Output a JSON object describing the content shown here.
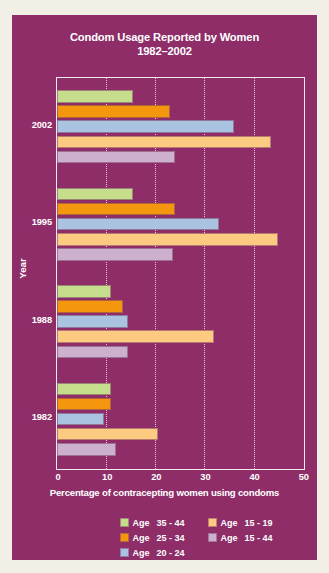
{
  "chart_data": {
    "type": "bar",
    "orientation": "horizontal",
    "title": "Condom Usage Reported by Women",
    "subtitle": "1982–2002",
    "xlabel": "Percentage of contracepting women using condoms",
    "ylabel": "Year",
    "xlim": [
      0,
      50
    ],
    "xticks": [
      0,
      10,
      20,
      30,
      40,
      50
    ],
    "xtick_labels": [
      "0",
      "10",
      "20",
      "30",
      "40",
      "50"
    ],
    "categories": [
      "2002",
      "1995",
      "1988",
      "1982"
    ],
    "grid": "vertical-dotted",
    "legend_position": "bottom-right",
    "series": [
      {
        "name": "Age  35 - 44",
        "color": "#c6dd8c",
        "values": [
          15.5,
          15.5,
          11.0,
          11.0
        ]
      },
      {
        "name": "Age  25 - 34",
        "color": "#f5970e",
        "values": [
          23.0,
          24.0,
          13.5,
          11.0
        ]
      },
      {
        "name": "Age  20 - 24",
        "color": "#a9c3e1",
        "values": [
          36.0,
          33.0,
          14.5,
          9.5
        ]
      },
      {
        "name": "Age  15 - 19",
        "color": "#fcca80",
        "values": [
          43.5,
          45.0,
          32.0,
          20.5
        ]
      },
      {
        "name": "Age  15 - 44",
        "color": "#ccb0cd",
        "values": [
          24.0,
          23.5,
          14.5,
          12.0
        ]
      }
    ]
  },
  "legend": {
    "rows": [
      [
        {
          "label": "Age",
          "range": "35 - 44",
          "color": "#c6dd8c"
        },
        {
          "label": "Age",
          "range": "15 - 19",
          "color": "#fcca80"
        }
      ],
      [
        {
          "label": "Age",
          "range": "25 - 34",
          "color": "#f5970e"
        },
        {
          "label": "Age",
          "range": "15 - 44",
          "color": "#ccb0cd"
        }
      ],
      [
        {
          "label": "Age",
          "range": "20 - 24",
          "color": "#a9c3e1"
        }
      ]
    ]
  },
  "colors": {
    "background": "#8e2d68",
    "frame": "#f4e9f0",
    "text": "#ffffff",
    "gridline": "#f0dce8"
  }
}
